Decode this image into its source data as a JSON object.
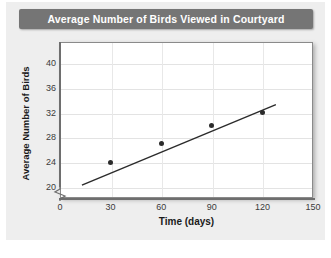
{
  "chart_data": {
    "type": "scatter",
    "title": "Average Number of Birds Viewed in Courtyard",
    "xlabel": "Time (days)",
    "ylabel": "Average Number of Birds",
    "xlim": [
      0,
      150
    ],
    "ylim": [
      20,
      40
    ],
    "y_axis_break": true,
    "grid": true,
    "legend": "none",
    "x_ticks": [
      "0",
      "30",
      "60",
      "90",
      "120",
      "150"
    ],
    "x_tick_values": [
      0,
      30,
      60,
      90,
      120,
      150
    ],
    "y_ticks": [
      "20",
      "24",
      "28",
      "32",
      "36",
      "40"
    ],
    "y_tick_values": [
      20,
      24,
      28,
      32,
      36,
      40
    ],
    "x": [
      30,
      60,
      90,
      120
    ],
    "values": [
      24,
      27,
      30,
      32
    ],
    "point_color": "#2b2b2b",
    "trendline": {
      "label": "line of best fit",
      "x_start": 13,
      "y_start": 20.3,
      "x_end": 128,
      "y_end": 33.3,
      "color": "#2b2b2b"
    }
  },
  "header": {
    "title": "Average Number of Birds Viewed in Courtyard",
    "title_bg": "#757575",
    "title_color": "#ffffff"
  },
  "axes": {
    "y_title": "Average Number of Birds",
    "x_title": "Time (days)",
    "break_icon": "axis-break-icon"
  },
  "colors": {
    "card_bg": "#eeeeee",
    "plot_bg": "#ffffff",
    "grid": "#e3e3e3",
    "axis": "#6e6e6e"
  }
}
